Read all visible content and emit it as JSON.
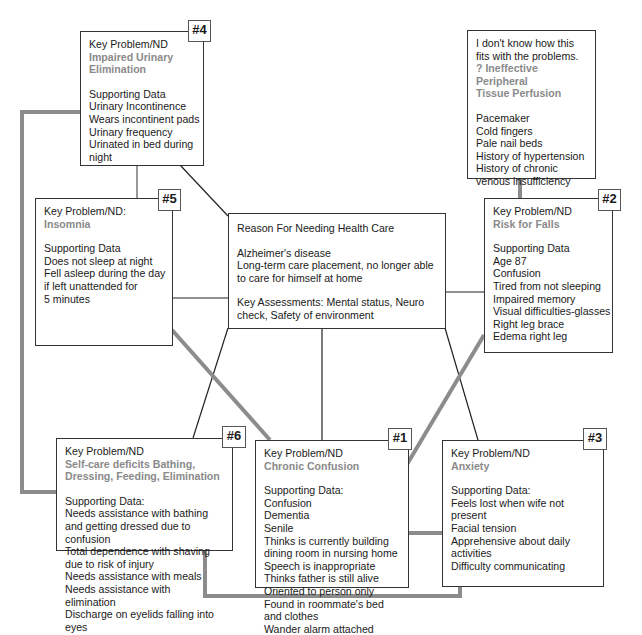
{
  "center": {
    "title": "Reason For Needing Health Care",
    "reason_lines": [
      "Alzheimer's disease",
      "Long-term care placement, no longer able",
      "to care for himself at home"
    ],
    "assess_lines": [
      "Key Assessments: Mental status, Neuro",
      "check, Safety of environment"
    ]
  },
  "problems": [
    {
      "badge": "#1",
      "label": "Key Problem/ND",
      "diagnosis": [
        "Chronic Confusion"
      ],
      "data_label": "Supporting Data:",
      "data": [
        "Confusion",
        "Dementia",
        "Senile",
        "Thinks is currently building",
        "dining room in nursing home",
        "Speech is inappropriate",
        "Thinks father is still alive",
        "Oriented to person only",
        "Found in roommate's bed",
        "and clothes",
        "Wander alarm attached"
      ]
    },
    {
      "badge": "#2",
      "label": "Key Problem/ND",
      "diagnosis": [
        "Risk for Falls"
      ],
      "data_label": "Supporting Data",
      "data": [
        "Age 87",
        "Confusion",
        "Tired from not sleeping",
        "Impaired memory",
        "Visual difficulties-glasses",
        "Right leg brace",
        "Edema right leg"
      ]
    },
    {
      "badge": "#3",
      "label": "Key Problem/ND",
      "diagnosis": [
        "Anxiety"
      ],
      "data_label": "Supporting Data:",
      "data": [
        "Feels lost when wife not",
        "present",
        "Facial tension",
        "Apprehensive about daily",
        "activities",
        "Difficulty communicating"
      ]
    },
    {
      "badge": "#4",
      "label": "Key Problem/ND",
      "diagnosis": [
        "Impaired Urinary",
        "Elimination"
      ],
      "data_label": "Supporting Data",
      "data": [
        "Urinary Incontinence",
        "Wears incontinent pads",
        "Urinary frequency",
        "Urinated in bed during",
        "night"
      ]
    },
    {
      "badge": "#5",
      "label": "Key Problem/ND:",
      "diagnosis": [
        "Insomnia"
      ],
      "data_label": "Supporting Data",
      "data": [
        "Does not sleep at night",
        "Fell asleep during the day",
        "if left unattended for",
        "5 minutes"
      ]
    },
    {
      "badge": "#6",
      "label": "Key Problem/ND",
      "diagnosis": [
        "Self-care deficits Bathing,",
        "Dressing, Feeding, Elimination"
      ],
      "data_label": "Supporting Data:",
      "data": [
        "Needs assistance with bathing",
        "and getting dressed due to",
        "confusion",
        "Total dependence with shaving",
        "due to risk of injury",
        "Needs assistance with meals",
        "Needs assistance with",
        "elimination",
        "Discharge on eyelids falling into",
        "eyes"
      ]
    }
  ],
  "unlinked": {
    "intro": [
      "I don't know how this",
      "fits with the problems."
    ],
    "diagnosis": [
      "? Ineffective Peripheral",
      "Tissue Perfusion"
    ],
    "data": [
      "Pacemaker",
      "Cold fingers",
      "Pale nail beds",
      "History of hypertension",
      "History of chronic",
      "venous insufficiency"
    ]
  },
  "colors": {
    "thin_link": "#222222",
    "thick_link": "#8c8c8c",
    "nd_text": "#8a8a8a"
  }
}
